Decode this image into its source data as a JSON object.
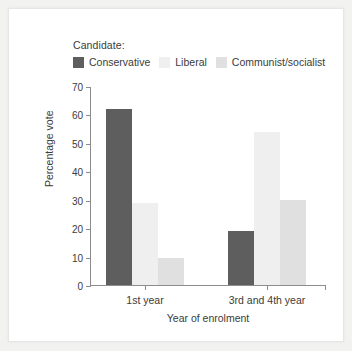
{
  "chart_data": {
    "type": "bar",
    "title": "",
    "xlabel": "Year of enrolment",
    "ylabel": "Percentage vote",
    "ylim": [
      0,
      70
    ],
    "yticks": [
      0,
      10,
      20,
      30,
      40,
      50,
      60,
      70
    ],
    "grid": false,
    "legend_title": "Candidate:",
    "legend_position": "top",
    "categories": [
      "1st year",
      "3rd and 4th year"
    ],
    "series": [
      {
        "name": "Conservative",
        "color": "#5e5e5e",
        "values": [
          62,
          19
        ]
      },
      {
        "name": "Liberal",
        "color": "#efefef",
        "values": [
          29,
          54
        ]
      },
      {
        "name": "Communist/socialist",
        "color": "#e0e0e0",
        "values": [
          9.5,
          30
        ]
      }
    ]
  },
  "axes": {
    "y_title": "Percentage vote",
    "x_title": "Year of enrolment",
    "y_tick_labels": [
      "0",
      "10",
      "20",
      "30",
      "40",
      "50",
      "60",
      "70"
    ],
    "x_tick_labels": [
      "1st year",
      "3rd and 4th year"
    ]
  },
  "legend": {
    "title": "Candidate:",
    "items": [
      {
        "label": "Conservative",
        "color": "#5e5e5e"
      },
      {
        "label": "Liberal",
        "color": "#efefef"
      },
      {
        "label": "Communist/socialist",
        "color": "#e0e0e0"
      }
    ]
  },
  "colors": {
    "panel_background": "#ffffff",
    "page_background": "#f2f2f0",
    "axis": "#8c8c8c",
    "text": "#3b3b3b"
  }
}
